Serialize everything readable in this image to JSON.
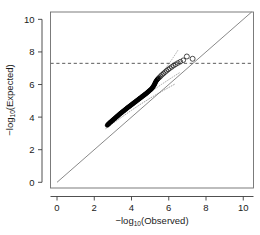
{
  "chart_data": {
    "type": "scatter",
    "title": "",
    "subtitle": "",
    "xlabel": "−log10(Observed)",
    "ylabel": "−log10(Expected)",
    "xlabel_parts": {
      "prefix": "−log",
      "sub": "10",
      "suffix": "(Observed)"
    },
    "ylabel_parts": {
      "prefix": "−log",
      "sub": "10",
      "suffix": "(Expected)"
    },
    "xlim": [
      -0.35,
      10.55
    ],
    "ylim": [
      -0.35,
      10.45
    ],
    "xticks": [
      0,
      2,
      4,
      6,
      8,
      10
    ],
    "yticks": [
      0,
      2,
      4,
      6,
      8,
      10
    ],
    "xticklabels": [
      "0",
      "2",
      "4",
      "6",
      "8",
      "10"
    ],
    "yticklabels": [
      "0",
      "2",
      "4",
      "6",
      "8",
      "10"
    ],
    "grid": false,
    "legend": false,
    "legend_position": "none",
    "frame": "box",
    "reference_lines": [
      {
        "name": "identity-line",
        "kind": "diagonal",
        "from": [
          0,
          0
        ],
        "to": [
          10.45,
          10.45
        ],
        "style": "solid",
        "color": "#6b6b6b",
        "width": 0.8
      },
      {
        "name": "significance-threshold",
        "kind": "horizontal",
        "y": 7.3,
        "style": "dashed",
        "color": "#4a4a4a",
        "width": 0.9,
        "label": ""
      }
    ],
    "confidence_bands": [
      {
        "name": "lower-band",
        "style": "dotted",
        "color": "#8c8c8c",
        "points": [
          [
            2.62,
            3.3
          ],
          [
            3.0,
            3.62
          ],
          [
            3.5,
            4.02
          ],
          [
            4.0,
            4.42
          ],
          [
            4.5,
            4.8
          ],
          [
            5.0,
            5.16
          ],
          [
            5.5,
            5.5
          ],
          [
            6.0,
            5.82
          ],
          [
            6.35,
            6.04
          ]
        ]
      },
      {
        "name": "upper-band",
        "style": "dotted",
        "color": "#9a9a9a",
        "points": [
          [
            2.7,
            3.48
          ],
          [
            3.2,
            3.95
          ],
          [
            3.8,
            4.5
          ],
          [
            4.4,
            5.02
          ],
          [
            5.0,
            5.52
          ],
          [
            5.6,
            6.0
          ],
          [
            6.2,
            6.45
          ],
          [
            6.6,
            6.74
          ]
        ]
      },
      {
        "name": "upper-band-extension",
        "style": "dotted",
        "color": "#a5a5a5",
        "points": [
          [
            5.4,
            6.35
          ],
          [
            5.8,
            6.95
          ],
          [
            6.1,
            7.42
          ],
          [
            6.35,
            7.85
          ],
          [
            6.5,
            8.12
          ]
        ]
      }
    ],
    "series": [
      {
        "name": "observed-vs-expected-filled",
        "marker": "filled-circle",
        "color": "#000000",
        "size": 2.1,
        "points": [
          [
            2.7,
            3.5
          ],
          [
            2.74,
            3.55
          ],
          [
            2.78,
            3.6
          ],
          [
            2.82,
            3.64
          ],
          [
            2.86,
            3.68
          ],
          [
            2.9,
            3.72
          ],
          [
            2.94,
            3.76
          ],
          [
            2.98,
            3.8
          ],
          [
            3.02,
            3.84
          ],
          [
            3.06,
            3.88
          ],
          [
            3.1,
            3.92
          ],
          [
            3.14,
            3.96
          ],
          [
            3.18,
            4.0
          ],
          [
            3.22,
            4.04
          ],
          [
            3.26,
            4.08
          ],
          [
            3.3,
            4.12
          ],
          [
            3.34,
            4.16
          ],
          [
            3.38,
            4.2
          ],
          [
            3.42,
            4.24
          ],
          [
            3.46,
            4.27
          ],
          [
            3.5,
            4.31
          ],
          [
            3.54,
            4.35
          ],
          [
            3.58,
            4.38
          ],
          [
            3.62,
            4.42
          ],
          [
            3.66,
            4.46
          ],
          [
            3.7,
            4.49
          ],
          [
            3.74,
            4.53
          ],
          [
            3.78,
            4.57
          ],
          [
            3.82,
            4.6
          ],
          [
            3.86,
            4.64
          ],
          [
            3.9,
            4.67
          ],
          [
            3.94,
            4.71
          ],
          [
            3.98,
            4.74
          ],
          [
            4.02,
            4.78
          ],
          [
            4.06,
            4.81
          ],
          [
            4.1,
            4.85
          ],
          [
            4.14,
            4.88
          ],
          [
            4.18,
            4.92
          ],
          [
            4.22,
            4.95
          ],
          [
            4.26,
            4.99
          ],
          [
            4.3,
            5.02
          ],
          [
            4.34,
            5.06
          ],
          [
            4.38,
            5.09
          ],
          [
            4.42,
            5.13
          ],
          [
            4.46,
            5.16
          ],
          [
            4.5,
            5.2
          ],
          [
            4.54,
            5.23
          ],
          [
            4.58,
            5.27
          ],
          [
            4.62,
            5.3
          ],
          [
            4.66,
            5.34
          ],
          [
            4.7,
            5.37
          ],
          [
            4.74,
            5.41
          ],
          [
            4.78,
            5.44
          ],
          [
            4.82,
            5.48
          ],
          [
            4.86,
            5.52
          ],
          [
            4.9,
            5.56
          ],
          [
            4.94,
            5.6
          ],
          [
            4.98,
            5.64
          ],
          [
            5.02,
            5.68
          ],
          [
            5.06,
            5.72
          ],
          [
            5.1,
            5.77
          ],
          [
            5.13,
            5.82
          ],
          [
            5.16,
            5.87
          ],
          [
            5.19,
            5.92
          ],
          [
            5.22,
            5.97
          ],
          [
            5.24,
            6.02
          ],
          [
            5.26,
            6.07
          ],
          [
            5.28,
            6.12
          ],
          [
            5.3,
            6.17
          ],
          [
            5.33,
            6.22
          ],
          [
            5.36,
            6.27
          ],
          [
            5.39,
            6.31
          ],
          [
            5.42,
            6.35
          ],
          [
            5.45,
            6.39
          ]
        ]
      },
      {
        "name": "observed-vs-expected-open",
        "marker": "open-circle",
        "color": "#2a2a2a",
        "size": 2.3,
        "points": [
          [
            5.5,
            6.44
          ],
          [
            5.57,
            6.52
          ],
          [
            5.64,
            6.6
          ],
          [
            5.72,
            6.68
          ],
          [
            5.8,
            6.76
          ],
          [
            5.88,
            6.84
          ],
          [
            5.97,
            6.92
          ],
          [
            6.06,
            7.0
          ],
          [
            6.16,
            7.08
          ],
          [
            6.26,
            7.16
          ],
          [
            6.37,
            7.24
          ],
          [
            6.49,
            7.32
          ],
          [
            6.62,
            7.4
          ],
          [
            6.78,
            7.49
          ]
        ]
      },
      {
        "name": "outlier-points",
        "marker": "open-circle",
        "color": "#2a2a2a",
        "size": 2.5,
        "points": [
          [
            6.97,
            7.72
          ],
          [
            7.28,
            7.58
          ]
        ]
      }
    ]
  }
}
